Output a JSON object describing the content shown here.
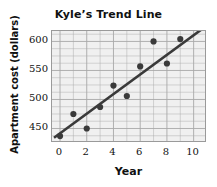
{
  "chart_data": {
    "type": "scatter",
    "title": "Kyle’s Trend Line",
    "xlabel": "Year",
    "ylabel": "Apartment cost (dollars)",
    "xlim": [
      -0.6,
      11.0
    ],
    "ylim": [
      425,
      618
    ],
    "grid": true,
    "legend": "none",
    "xticks": [
      0,
      2,
      4,
      6,
      8,
      10
    ],
    "xtick_labels": [
      "0",
      "2",
      "4",
      "6",
      "8",
      "10"
    ],
    "yticks": [
      450,
      500,
      550,
      600
    ],
    "ytick_labels": [
      "450",
      "500",
      "550",
      "600"
    ],
    "x_minor_step": 1,
    "y_minor_step": 12.5,
    "point_color": "#3a3a3a",
    "line_color": "#3a3a3a",
    "grid_color": "#a8a8a8",
    "plot_background": "#f0f0f0",
    "x": [
      0,
      1,
      2,
      3,
      4,
      5,
      6,
      7,
      8,
      9
    ],
    "values": [
      437,
      475,
      450,
      487,
      524,
      506,
      557,
      600,
      562,
      604
    ],
    "points": [
      {
        "x": 0,
        "y": 437
      },
      {
        "x": 1,
        "y": 475
      },
      {
        "x": 2,
        "y": 450
      },
      {
        "x": 3,
        "y": 487
      },
      {
        "x": 4,
        "y": 524
      },
      {
        "x": 5,
        "y": 506
      },
      {
        "x": 6,
        "y": 557
      },
      {
        "x": 7,
        "y": 600
      },
      {
        "x": 8,
        "y": 562
      },
      {
        "x": 9,
        "y": 604
      }
    ],
    "trend_line": {
      "name": "Kyle’s trend line",
      "x_start": -0.45,
      "y_start": 434,
      "x_end": 10.55,
      "y_end": 620
    }
  }
}
